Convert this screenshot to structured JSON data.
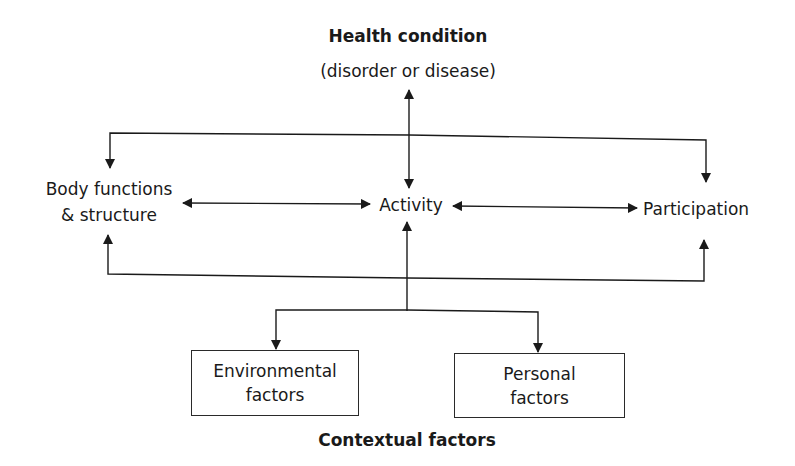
{
  "diagram": {
    "type": "flowchart",
    "colors": {
      "line": "#1a1a1a",
      "text": "#1a1a1a",
      "background": "#ffffff"
    },
    "health_condition": {
      "title": "Health condition",
      "subtitle": "(disorder or disease)"
    },
    "nodes": {
      "body_functions": {
        "line1": "Body functions",
        "line2": "& structure"
      },
      "activity": {
        "label": "Activity"
      },
      "participation": {
        "label": "Participation"
      },
      "environmental_factors": {
        "line1": "Environmental",
        "line2": "factors"
      },
      "personal_factors": {
        "line1": "Personal",
        "line2": "factors"
      }
    },
    "contextual_factors": {
      "label": "Contextual factors"
    },
    "edges": [
      {
        "from": "health_condition",
        "to": "activity",
        "direction": "bidirectional"
      },
      {
        "from": "body_functions",
        "to": "activity",
        "direction": "bidirectional"
      },
      {
        "from": "activity",
        "to": "participation",
        "direction": "bidirectional"
      },
      {
        "from": "health_condition",
        "to": "body_functions",
        "direction": "forward"
      },
      {
        "from": "health_condition",
        "to": "participation",
        "direction": "forward"
      },
      {
        "from": "contextual_factors",
        "to": "body_functions",
        "direction": "forward"
      },
      {
        "from": "contextual_factors",
        "to": "activity",
        "direction": "forward"
      },
      {
        "from": "contextual_factors",
        "to": "participation",
        "direction": "forward"
      },
      {
        "from": "activity",
        "to": "environmental_factors",
        "direction": "forward"
      },
      {
        "from": "activity",
        "to": "personal_factors",
        "direction": "forward"
      }
    ]
  }
}
